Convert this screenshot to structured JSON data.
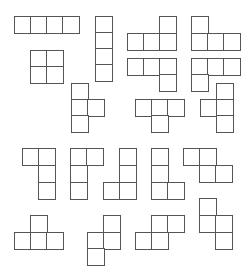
{
  "diagram": {
    "title": "",
    "cell_size": 16,
    "line_color": "#555555",
    "background": "#ffffff",
    "shapes": [
      {
        "name": "i-tetromino-horizontal",
        "cells": [
          [
            14,
            16
          ],
          [
            30,
            16
          ],
          [
            46,
            16
          ],
          [
            62,
            16
          ]
        ]
      },
      {
        "name": "i-tetromino-vertical",
        "cells": [
          [
            95,
            16
          ],
          [
            95,
            32
          ],
          [
            95,
            48
          ],
          [
            95,
            64
          ]
        ]
      },
      {
        "name": "o-tetromino",
        "cells": [
          [
            30,
            50
          ],
          [
            46,
            50
          ],
          [
            30,
            66
          ],
          [
            46,
            66
          ]
        ]
      },
      {
        "name": "l-tetromino-up-right",
        "cells": [
          [
            159,
            16
          ],
          [
            127,
            33
          ],
          [
            143,
            33
          ],
          [
            159,
            33
          ]
        ]
      },
      {
        "name": "j-tetromino-up-left",
        "cells": [
          [
            191,
            16
          ],
          [
            191,
            33
          ],
          [
            207,
            33
          ],
          [
            223,
            33
          ]
        ]
      },
      {
        "name": "j-tetromino-down-right",
        "cells": [
          [
            127,
            58
          ],
          [
            143,
            58
          ],
          [
            159,
            58
          ],
          [
            159,
            74
          ]
        ]
      },
      {
        "name": "l-tetromino-down-left",
        "cells": [
          [
            191,
            58
          ],
          [
            207,
            58
          ],
          [
            223,
            58
          ],
          [
            191,
            74
          ]
        ]
      },
      {
        "name": "t-tetromino-right",
        "cells": [
          [
            71,
            83
          ],
          [
            71,
            99
          ],
          [
            87,
            99
          ],
          [
            71,
            115
          ]
        ]
      },
      {
        "name": "t-tetromino-down",
        "cells": [
          [
            135,
            99
          ],
          [
            151,
            99
          ],
          [
            167,
            99
          ],
          [
            151,
            115
          ]
        ]
      },
      {
        "name": "t-tetromino-left",
        "cells": [
          [
            216,
            83
          ],
          [
            200,
            99
          ],
          [
            216,
            99
          ],
          [
            216,
            115
          ]
        ]
      },
      {
        "name": "l-tetromino-top-left",
        "cells": [
          [
            22,
            148
          ],
          [
            38,
            148
          ],
          [
            38,
            165
          ],
          [
            38,
            182
          ]
        ]
      },
      {
        "name": "j-tetromino-top-right",
        "cells": [
          [
            70,
            148
          ],
          [
            86,
            148
          ],
          [
            70,
            165
          ],
          [
            70,
            182
          ]
        ]
      },
      {
        "name": "j-tetromino-bottom-left",
        "cells": [
          [
            119,
            148
          ],
          [
            119,
            165
          ],
          [
            103,
            182
          ],
          [
            119,
            182
          ]
        ]
      },
      {
        "name": "l-tetromino-bottom-right",
        "cells": [
          [
            151,
            148
          ],
          [
            151,
            165
          ],
          [
            151,
            182
          ],
          [
            167,
            182
          ]
        ]
      },
      {
        "name": "z-tetromino-horizontal",
        "cells": [
          [
            183,
            148
          ],
          [
            199,
            148
          ],
          [
            199,
            165
          ],
          [
            215,
            165
          ]
        ]
      },
      {
        "name": "t-tetromino-up",
        "cells": [
          [
            30,
            215
          ],
          [
            14,
            232
          ],
          [
            30,
            232
          ],
          [
            46,
            232
          ]
        ]
      },
      {
        "name": "z-tetromino-vertical",
        "cells": [
          [
            103,
            215
          ],
          [
            87,
            232
          ],
          [
            103,
            232
          ],
          [
            87,
            248
          ]
        ]
      },
      {
        "name": "s-tetromino-horizontal",
        "cells": [
          [
            151,
            215
          ],
          [
            167,
            215
          ],
          [
            135,
            232
          ],
          [
            151,
            232
          ]
        ]
      },
      {
        "name": "s-tetromino-vertical",
        "cells": [
          [
            199,
            198
          ],
          [
            199,
            215
          ],
          [
            215,
            215
          ],
          [
            215,
            232
          ]
        ]
      }
    ]
  }
}
